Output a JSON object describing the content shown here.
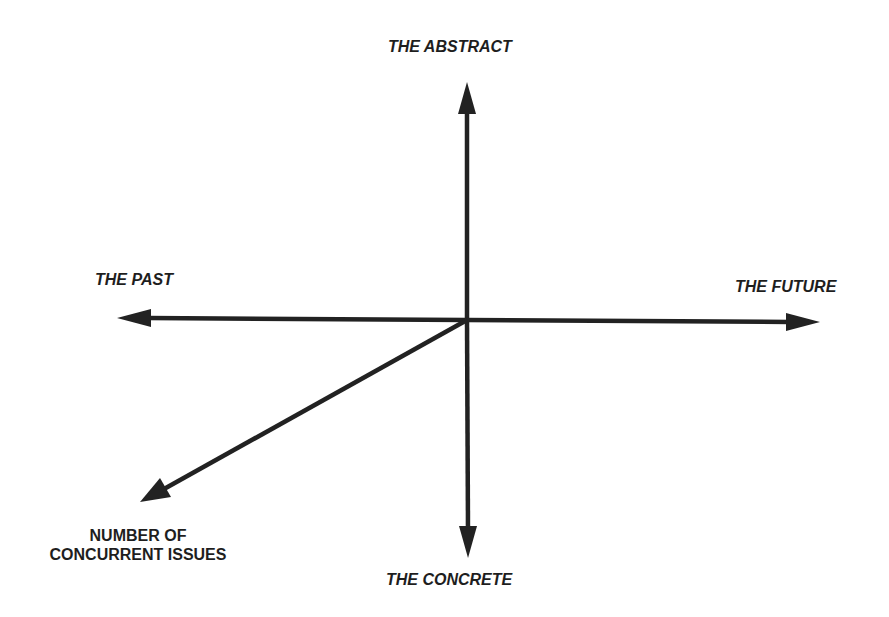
{
  "diagram": {
    "type": "axes-diagram",
    "origin": [
      467,
      320
    ],
    "colors": {
      "line": "#222222",
      "text": "#1e1e1e",
      "background": "#ffffff"
    },
    "axes": [
      {
        "id": "up",
        "label": "THE ABSTRACT",
        "from": [
          467,
          320
        ],
        "to": [
          467,
          82
        ]
      },
      {
        "id": "down",
        "label": "THE CONCRETE",
        "from": [
          467,
          320
        ],
        "to": [
          468,
          558
        ]
      },
      {
        "id": "left",
        "label": "THE PAST",
        "from": [
          467,
          320
        ],
        "to": [
          117,
          318
        ]
      },
      {
        "id": "right",
        "label": "THE FUTURE",
        "from": [
          467,
          320
        ],
        "to": [
          820,
          322
        ]
      },
      {
        "id": "diagonal",
        "label": "NUMBER OF CONCURRENT ISSUES",
        "from": [
          467,
          320
        ],
        "to": [
          140,
          502
        ]
      }
    ]
  },
  "labels": {
    "abstract": "THE ABSTRACT",
    "concrete": "THE CONCRETE",
    "past": "THE PAST",
    "future": "THE FUTURE",
    "issues_line1": "NUMBER OF",
    "issues_line2": "CONCURRENT ISSUES"
  }
}
